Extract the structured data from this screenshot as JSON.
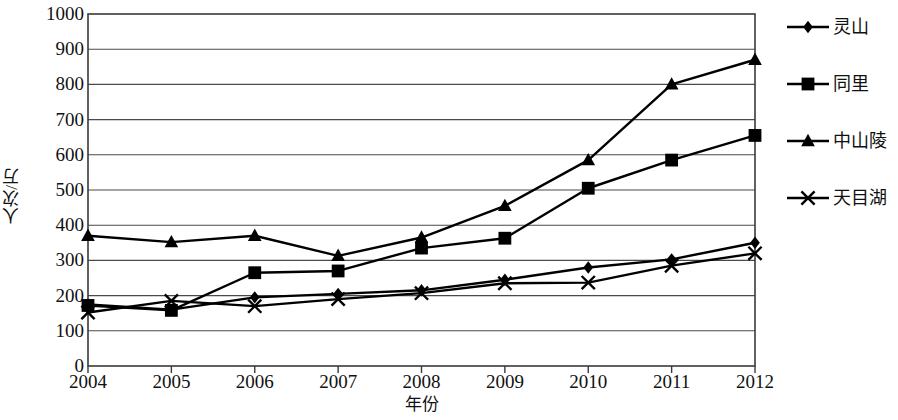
{
  "chart_data": {
    "type": "line",
    "title": "",
    "xlabel": "年份",
    "ylabel": "人次/万",
    "categories": [
      "2004",
      "2005",
      "2006",
      "2007",
      "2008",
      "2009",
      "2010",
      "2011",
      "2012"
    ],
    "x": [
      2004,
      2005,
      2006,
      2007,
      2008,
      2009,
      2010,
      2011,
      2012
    ],
    "xlim": [
      2004,
      2012
    ],
    "ylim": [
      0,
      1000
    ],
    "y_ticks": [
      0,
      100,
      200,
      300,
      400,
      500,
      600,
      700,
      800,
      900,
      1000
    ],
    "y_tick_labels": [
      "0",
      "100",
      "200",
      "300",
      "400",
      "500",
      "600",
      "700",
      "800",
      "900",
      "1000"
    ],
    "grid": "horizontal",
    "legend_position": "right",
    "series": [
      {
        "name": "灵山",
        "marker": "diamond",
        "color": "#000000",
        "values": [
          175,
          160,
          195,
          205,
          215,
          245,
          280,
          303,
          350
        ]
      },
      {
        "name": "同里",
        "marker": "square",
        "color": "#000000",
        "values": [
          172,
          158,
          265,
          270,
          335,
          363,
          505,
          585,
          655
        ]
      },
      {
        "name": "中山陵",
        "marker": "triangle",
        "color": "#000000",
        "values": [
          370,
          352,
          370,
          313,
          365,
          455,
          585,
          800,
          870
        ]
      },
      {
        "name": "天目湖",
        "marker": "cross-x",
        "color": "#000000",
        "values": [
          152,
          185,
          170,
          190,
          207,
          235,
          237,
          285,
          320
        ]
      }
    ]
  },
  "legend": {
    "items": [
      {
        "label": "灵山",
        "marker": "diamond-marker-icon"
      },
      {
        "label": "同里",
        "marker": "square-marker-icon"
      },
      {
        "label": "中山陵",
        "marker": "triangle-marker-icon"
      },
      {
        "label": "天目湖",
        "marker": "cross-marker-icon"
      }
    ]
  }
}
